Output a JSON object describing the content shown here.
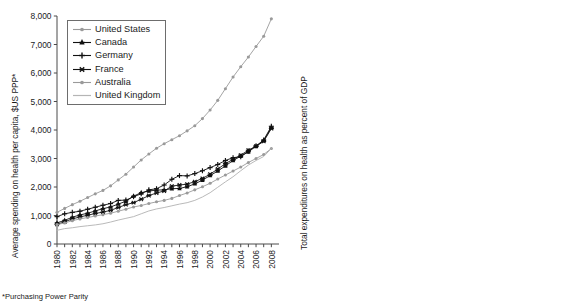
{
  "figure": {
    "footnote": "*Purchasing Power Parity",
    "colors": {
      "united_states": "#9a9a9a",
      "canada": "#111111",
      "germany": "#111111",
      "france": "#111111",
      "australia": "#9a9a9a",
      "united_kingdom": "#b5b5b5",
      "axis": "#4a4a4a",
      "text": "#1a1a1a",
      "legend_border": "#6d6d6d"
    }
  },
  "chart_data": [
    {
      "id": "spending-per-capita",
      "type": "line",
      "title": "",
      "xlabel": "",
      "ylabel": "Average spending on health per capita, $US PPP*",
      "xlim": [
        1980,
        2009
      ],
      "ylim": [
        0,
        8000
      ],
      "ytick_step": 1000,
      "yticks": [
        0,
        1000,
        2000,
        3000,
        4000,
        5000,
        6000,
        7000,
        8000
      ],
      "ytick_labels": [
        "0",
        "1,000",
        "2,000",
        "3,000",
        "4,000",
        "5,000",
        "6,000",
        "7,000",
        "8,000"
      ],
      "x": [
        1980,
        1981,
        1982,
        1983,
        1984,
        1985,
        1986,
        1987,
        1988,
        1989,
        1990,
        1991,
        1992,
        1993,
        1994,
        1995,
        1996,
        1997,
        1998,
        1999,
        2000,
        2001,
        2002,
        2003,
        2004,
        2005,
        2006,
        2007,
        2008
      ],
      "xtick_labels": [
        "1980",
        "1982",
        "1984",
        "1986",
        "1988",
        "1990",
        "1992",
        "1994",
        "1996",
        "1998",
        "2000",
        "2002",
        "2004",
        "2006",
        "2008"
      ],
      "grid": false,
      "legend_position": "upper-left",
      "series": [
        {
          "name": "United States",
          "marker": "dot",
          "color": "#9a9a9a",
          "values": [
            1110,
            1250,
            1380,
            1500,
            1630,
            1760,
            1880,
            2040,
            2250,
            2450,
            2700,
            2950,
            3160,
            3360,
            3520,
            3660,
            3800,
            3970,
            4150,
            4400,
            4700,
            5040,
            5450,
            5860,
            6220,
            6560,
            6930,
            7290,
            7900
          ]
        },
        {
          "name": "Canada",
          "marker": "star",
          "color": "#111111",
          "values": [
            740,
            830,
            940,
            1020,
            1080,
            1160,
            1240,
            1300,
            1400,
            1500,
            1680,
            1800,
            1860,
            1890,
            1900,
            1940,
            1950,
            2010,
            2110,
            2240,
            2400,
            2560,
            2740,
            2930,
            3080,
            3230,
            3430,
            3630,
            4080
          ]
        },
        {
          "name": "Germany",
          "marker": "plus",
          "color": "#111111",
          "values": [
            960,
            1060,
            1110,
            1150,
            1220,
            1290,
            1360,
            1420,
            1530,
            1540,
            1660,
            1760,
            1900,
            1940,
            2070,
            2270,
            2400,
            2390,
            2470,
            2570,
            2680,
            2790,
            2930,
            3030,
            3060,
            3260,
            3440,
            3650,
            4130
          ]
        },
        {
          "name": "France",
          "marker": "starx",
          "color": "#111111",
          "values": [
            690,
            780,
            880,
            950,
            1010,
            1070,
            1120,
            1180,
            1280,
            1380,
            1450,
            1570,
            1700,
            1790,
            1860,
            2030,
            2070,
            2100,
            2190,
            2300,
            2450,
            2630,
            2820,
            2970,
            3120,
            3290,
            3430,
            3600,
            4050
          ]
        },
        {
          "name": "Australia",
          "marker": "dot",
          "color": "#9a9a9a",
          "values": [
            680,
            740,
            820,
            880,
            930,
            980,
            1030,
            1080,
            1150,
            1220,
            1300,
            1350,
            1420,
            1480,
            1530,
            1600,
            1700,
            1790,
            1900,
            2010,
            2130,
            2280,
            2420,
            2560,
            2700,
            2860,
            3000,
            3140,
            3350
          ]
        },
        {
          "name": "United Kingdom",
          "marker": "none",
          "color": "#b5b5b5",
          "values": [
            480,
            540,
            570,
            610,
            640,
            670,
            710,
            770,
            840,
            900,
            960,
            1060,
            1160,
            1230,
            1280,
            1340,
            1400,
            1450,
            1530,
            1650,
            1800,
            1990,
            2180,
            2360,
            2570,
            2770,
            2930,
            3070,
            3350
          ]
        }
      ]
    },
    {
      "id": "health-percent-gdp",
      "type": "line",
      "title": "",
      "xlabel": "",
      "ylabel": "Total expenditures on health as percent of GDP",
      "xlim": [
        1980,
        2009
      ],
      "ylim": [
        0,
        18
      ],
      "ytick_step": 2,
      "yticks": [
        0,
        2,
        4,
        6,
        8,
        10,
        12,
        14,
        16,
        18
      ],
      "ytick_labels": [
        "0",
        "2",
        "4",
        "6",
        "8",
        "10",
        "12",
        "14",
        "16",
        "18"
      ],
      "x": [
        1980,
        1981,
        1982,
        1983,
        1984,
        1985,
        1986,
        1987,
        1988,
        1989,
        1990,
        1991,
        1992,
        1993,
        1994,
        1995,
        1996,
        1997,
        1998,
        1999,
        2000,
        2001,
        2002,
        2003,
        2004,
        2005,
        2006,
        2007,
        2008
      ],
      "xtick_labels": [
        "1980",
        "1982",
        "1984",
        "1986",
        "1988",
        "1990",
        "1992",
        "1994",
        "1996",
        "1998",
        "2000",
        "2002",
        "2004",
        "2006",
        "2008"
      ],
      "grid": false,
      "legend_position": "lower-right",
      "series": [
        {
          "name": "United States",
          "marker": "dot",
          "color": "#9a9a9a",
          "values": [
            9.0,
            9.5,
            10.2,
            10.3,
            10.3,
            10.5,
            10.7,
            10.9,
            11.3,
            11.6,
            12.2,
            12.9,
            13.3,
            13.6,
            13.7,
            13.7,
            13.6,
            13.6,
            13.6,
            13.6,
            13.7,
            14.5,
            15.3,
            15.7,
            15.7,
            15.7,
            15.8,
            16.0,
            17.4
          ]
        },
        {
          "name": "Canada",
          "marker": "starx",
          "color": "#111111",
          "values": [
            7.0,
            7.8,
            8.2,
            8.3,
            8.3,
            8.2,
            8.4,
            8.4,
            8.4,
            8.6,
            8.9,
            9.7,
            10.0,
            10.0,
            9.7,
            9.2,
            8.9,
            8.8,
            8.9,
            8.9,
            8.8,
            9.3,
            9.6,
            9.8,
            9.8,
            9.8,
            10.0,
            10.1,
            11.4
          ]
        },
        {
          "name": "Germany",
          "marker": "plus",
          "color": "#111111",
          "values": [
            8.4,
            8.6,
            8.6,
            8.6,
            8.7,
            8.8,
            8.7,
            8.9,
            8.8,
            8.3,
            8.3,
            8.7,
            9.4,
            9.6,
            9.8,
            10.1,
            10.4,
            10.2,
            10.2,
            10.3,
            10.3,
            10.4,
            10.6,
            10.8,
            10.6,
            10.7,
            10.5,
            10.5,
            11.6
          ]
        },
        {
          "name": "France",
          "marker": "star",
          "color": "#111111",
          "values": [
            7.0,
            7.3,
            7.5,
            7.7,
            7.8,
            7.9,
            7.9,
            8.0,
            8.2,
            8.2,
            8.4,
            8.7,
            9.1,
            9.6,
            9.5,
            10.4,
            10.4,
            10.2,
            10.1,
            10.1,
            10.1,
            10.2,
            10.5,
            10.9,
            11.0,
            11.0,
            11.0,
            11.0,
            11.7
          ]
        },
        {
          "name": "Australia",
          "marker": "none",
          "color": "#b5b5b5",
          "values": [
            5.8,
            6.0,
            6.2,
            6.4,
            6.6,
            6.6,
            6.7,
            6.7,
            6.7,
            6.8,
            6.9,
            7.1,
            7.3,
            7.4,
            7.4,
            7.4,
            7.5,
            7.6,
            7.7,
            7.9,
            8.0,
            8.2,
            8.3,
            8.4,
            8.4,
            8.4,
            8.5,
            8.5,
            8.7
          ]
        },
        {
          "name": "United Kingdom",
          "marker": "dot",
          "color": "#9a9a9a",
          "values": [
            5.6,
            6.0,
            5.8,
            5.8,
            5.9,
            5.9,
            5.9,
            5.9,
            5.9,
            5.8,
            5.9,
            6.3,
            6.6,
            6.7,
            6.8,
            6.8,
            6.9,
            6.8,
            6.9,
            7.0,
            7.0,
            7.3,
            7.6,
            7.8,
            8.0,
            8.2,
            8.5,
            8.5,
            8.7
          ]
        }
      ]
    }
  ],
  "legends": [
    {
      "id": "legend-left",
      "entries": [
        {
          "label": "United States",
          "marker": "dot",
          "color": "#9a9a9a"
        },
        {
          "label": "Canada",
          "marker": "star",
          "color": "#111111"
        },
        {
          "label": "Germany",
          "marker": "plus",
          "color": "#111111"
        },
        {
          "label": "France",
          "marker": "starx",
          "color": "#111111"
        },
        {
          "label": "Australia",
          "marker": "dot",
          "color": "#9a9a9a"
        },
        {
          "label": "United Kingdom",
          "marker": "none",
          "color": "#b5b5b5"
        }
      ]
    },
    {
      "id": "legend-right",
      "entries": [
        {
          "label": "United States",
          "marker": "dot",
          "color": "#9a9a9a"
        },
        {
          "label": "Canada",
          "marker": "starx",
          "color": "#111111"
        },
        {
          "label": "Germany",
          "marker": "plus",
          "color": "#111111"
        },
        {
          "label": "France",
          "marker": "star",
          "color": "#111111"
        },
        {
          "label": "Australia",
          "marker": "none",
          "color": "#b5b5b5"
        },
        {
          "label": "United Kingdom",
          "marker": "dot",
          "color": "#9a9a9a"
        }
      ]
    }
  ]
}
